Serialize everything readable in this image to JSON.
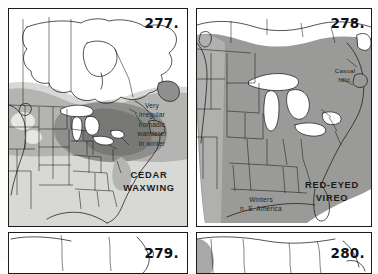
{
  "page": {
    "kind": "field-guide-range-map-plate",
    "background": "#fdfdfc"
  },
  "palette": {
    "ink": "#1b1b1b",
    "paper": "#ffffff",
    "water": "#ffffff",
    "shade_light": "#d8d8d6",
    "shade_mid": "#b4b4b2",
    "shade_dark": "#8f8f8d",
    "shade_darker": "#787876",
    "text": "#1a1a1a"
  },
  "panels": [
    {
      "id": "panel-277",
      "number": "277.",
      "species": "CEDAR\nWAXWING",
      "notes": [
        {
          "key": "winter-note",
          "text": "Very\nirregular\nnomadic\nwanderer\nin winter"
        }
      ]
    },
    {
      "id": "panel-278",
      "number": "278.",
      "species": "RED-EYED\nVIREO",
      "notes": [
        {
          "key": "casual-note",
          "text": "Casual\nNfld."
        },
        {
          "key": "winter-note",
          "text": "Winters\nn. S. America"
        }
      ]
    },
    {
      "id": "panel-279",
      "number": "279.",
      "species": "",
      "notes": []
    },
    {
      "id": "panel-280",
      "number": "280.",
      "species": "",
      "notes": []
    }
  ]
}
